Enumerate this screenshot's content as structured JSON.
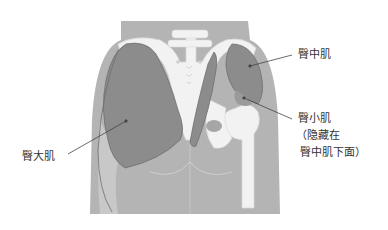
{
  "diagram": {
    "labels": {
      "gluteus_medius": "臀中肌",
      "gluteus_minimus": "臀小肌",
      "gluteus_minimus_note_line1": "（隐藏在",
      "gluteus_minimus_note_line2": "臀中肌下面）",
      "gluteus_maximus": "臀大肌"
    },
    "colors": {
      "background": "#ffffff",
      "body": "#b4b4b4",
      "body_light": "#c8c8c8",
      "muscle": "#8c8c8c",
      "muscle_outline": "#6e6e6e",
      "bone": "#f2f2f2",
      "bone_outline": "#d8d8d8",
      "leader_line": "#444444",
      "text": "#333333"
    }
  }
}
